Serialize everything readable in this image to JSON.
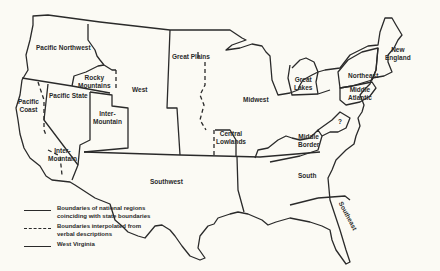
{
  "map": {
    "regions": [
      {
        "id": "pacific-northwest",
        "label": "Pacific Northwest"
      },
      {
        "id": "rocky-mountains",
        "label": "Rocky Mountains"
      },
      {
        "id": "west",
        "label": "West"
      },
      {
        "id": "great-plains",
        "label": "Great Plains"
      },
      {
        "id": "midwest",
        "label": "Midwest"
      },
      {
        "id": "great-lakes",
        "label": "Great Lakes"
      },
      {
        "id": "northeast",
        "label": "Northeast"
      },
      {
        "id": "new-england",
        "label": "New England"
      },
      {
        "id": "middle-atlantic",
        "label": "Middle Atlantic"
      },
      {
        "id": "pacific-coast",
        "label": "Pacific Coast"
      },
      {
        "id": "pacific-state",
        "label": "Pacific State"
      },
      {
        "id": "inter-mountain-north",
        "label": "Inter-Mountain"
      },
      {
        "id": "inter-mountain-south",
        "label": "Inter-Mountain"
      },
      {
        "id": "central-lowlands",
        "label": "Central Lowlands"
      },
      {
        "id": "middle-border",
        "label": "Middle Border"
      },
      {
        "id": "west-virginia",
        "label": "?"
      },
      {
        "id": "southwest",
        "label": "Southwest"
      },
      {
        "id": "south",
        "label": "South"
      },
      {
        "id": "southeast",
        "label": "Southeast"
      }
    ]
  },
  "legend": {
    "items": [
      {
        "style": "solid",
        "text": "Boundaries of national regions coinciding with state boundaries"
      },
      {
        "style": "dashed",
        "text": "Boundaries interpolated from verbal descriptions"
      },
      {
        "style": "solid",
        "text": "West Virginia"
      }
    ]
  },
  "labels": {
    "pacific_northwest": "Pacific Northwest",
    "rocky_1": "Rocky",
    "rocky_2": "Mountains",
    "west": "West",
    "great_plains": "Great Plains",
    "midwest": "Midwest",
    "great_lakes_1": "Great",
    "great_lakes_2": "Lakes",
    "northeast": "Northeast",
    "new_england_1": "New",
    "new_england_2": "England",
    "middle_atlantic_1": "Middle",
    "middle_atlantic_2": "Atlantic",
    "pacific_coast_1": "Pacific",
    "pacific_coast_2": "Coast",
    "pacific_state": "Pacific State",
    "inter_mountain_n_1": "Inter-",
    "inter_mountain_n_2": "Mountain",
    "inter_mountain_s_1": "Inter-",
    "inter_mountain_s_2": "Mountain",
    "central_lowlands_1": "Central",
    "central_lowlands_2": "Lowlands",
    "middle_border_1": "Middle",
    "middle_border_2": "Border",
    "west_virginia": "?",
    "southwest": "Southwest",
    "south": "South",
    "southeast": "Southeast",
    "legend_1a": "Boundaries of national regions",
    "legend_1b": "coinciding with state boundaries",
    "legend_2a": "Boundaries interpolated from",
    "legend_2b": "verbal descriptions",
    "legend_3": "West Virginia"
  }
}
